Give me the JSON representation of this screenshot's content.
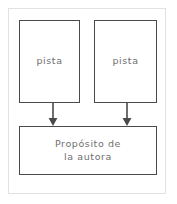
{
  "diagram": {
    "type": "flow-diagram",
    "title_text": "",
    "background_color": "#ffffff",
    "frame_color": "#e2e2e2",
    "box_border_color": "#4a4a4a",
    "text_color": "#6f6f6f",
    "arrow_color": "#4a4a4a",
    "nodes": [
      {
        "id": "clue-left",
        "label": "pista",
        "role": "evidence",
        "position": "top-left"
      },
      {
        "id": "clue-right",
        "label": "pista",
        "role": "evidence",
        "position": "top-right"
      },
      {
        "id": "purpose",
        "label_line1": "Propósito de",
        "label_line2": "la autora",
        "label": "Propósito de la autora",
        "role": "conclusion",
        "position": "bottom-center"
      }
    ],
    "edges": [
      {
        "id": "edge-left",
        "from": "clue-left",
        "to": "purpose",
        "style": "solid-arrow",
        "direction": "down"
      },
      {
        "id": "edge-right",
        "from": "clue-right",
        "to": "purpose",
        "style": "solid-arrow",
        "direction": "down"
      }
    ]
  }
}
